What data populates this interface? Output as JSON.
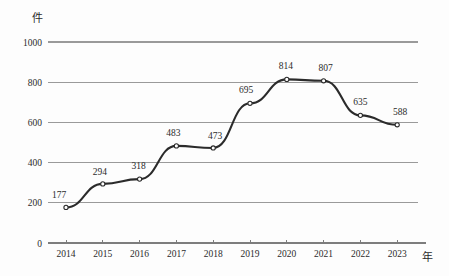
{
  "chart_data": {
    "type": "line",
    "title": "",
    "subtitle": "",
    "xlabel": "年",
    "ylabel": "件",
    "categories": [
      "2014",
      "2015",
      "2016",
      "2017",
      "2018",
      "2019",
      "2020",
      "2021",
      "2022",
      "2023"
    ],
    "values": [
      177,
      294,
      318,
      483,
      473,
      695,
      814,
      807,
      635,
      588
    ],
    "series": [
      {
        "name": "件数",
        "values": [
          177,
          294,
          318,
          483,
          473,
          695,
          814,
          807,
          635,
          588
        ]
      }
    ],
    "ylim": [
      0,
      1000
    ],
    "yticks": [
      0,
      200,
      400,
      600,
      800,
      1000
    ],
    "ytick_labels": [
      "0",
      "200",
      "400",
      "600",
      "800",
      "1000"
    ],
    "xtick_labels": [
      "2014",
      "2015",
      "2016",
      "2017",
      "2018",
      "2019",
      "2020",
      "2021",
      "2022",
      "2023"
    ],
    "data_labels": [
      "177",
      "294",
      "318",
      "483",
      "473",
      "695",
      "814",
      "807",
      "635",
      "588"
    ],
    "grid": true,
    "legend": false,
    "legend_position": "none",
    "line_color": "#2b2b2b",
    "grid_color": "#9a9a9a",
    "axis_color": "#7d7d7d",
    "marker": "open-circle",
    "smoothing": true,
    "background_color": "#fdfdfd"
  }
}
